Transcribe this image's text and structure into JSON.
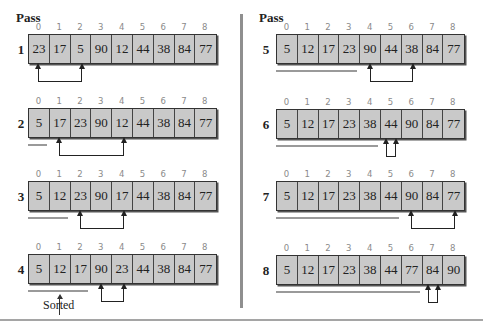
{
  "column_header": "Pass",
  "indices": [
    "0",
    "1",
    "2",
    "3",
    "4",
    "5",
    "6",
    "7",
    "8"
  ],
  "colors": {
    "cell_fill": "#c9c9c9",
    "border": "#333333",
    "index_text": "#8a8a8a",
    "divider": "#8f8f8f"
  },
  "sorted_label": "Sorted",
  "passes": [
    {
      "pass": "1",
      "values": [
        "23",
        "17",
        "5",
        "90",
        "12",
        "44",
        "38",
        "84",
        "77"
      ],
      "sorted_count": 0,
      "swap": [
        0,
        2
      ]
    },
    {
      "pass": "2",
      "values": [
        "5",
        "17",
        "23",
        "90",
        "12",
        "44",
        "38",
        "84",
        "77"
      ],
      "sorted_count": 1,
      "swap": [
        1,
        4
      ]
    },
    {
      "pass": "3",
      "values": [
        "5",
        "12",
        "23",
        "90",
        "17",
        "44",
        "38",
        "84",
        "77"
      ],
      "sorted_count": 2,
      "swap": [
        2,
        4
      ]
    },
    {
      "pass": "4",
      "values": [
        "5",
        "12",
        "17",
        "90",
        "23",
        "44",
        "38",
        "84",
        "77"
      ],
      "sorted_count": 3,
      "swap": [
        3,
        4
      ]
    },
    {
      "pass": "5",
      "values": [
        "5",
        "12",
        "17",
        "23",
        "90",
        "44",
        "38",
        "84",
        "77"
      ],
      "sorted_count": 4,
      "swap": [
        4,
        6
      ]
    },
    {
      "pass": "6",
      "values": [
        "5",
        "12",
        "17",
        "23",
        "38",
        "44",
        "90",
        "84",
        "77"
      ],
      "sorted_count": 5,
      "swap": [
        5,
        5
      ]
    },
    {
      "pass": "7",
      "values": [
        "5",
        "12",
        "17",
        "23",
        "38",
        "44",
        "90",
        "84",
        "77"
      ],
      "sorted_count": 6,
      "swap": [
        6,
        8
      ]
    },
    {
      "pass": "8",
      "values": [
        "5",
        "12",
        "17",
        "23",
        "38",
        "44",
        "77",
        "84",
        "90"
      ],
      "sorted_count": 7,
      "swap": [
        7,
        7
      ]
    }
  ]
}
